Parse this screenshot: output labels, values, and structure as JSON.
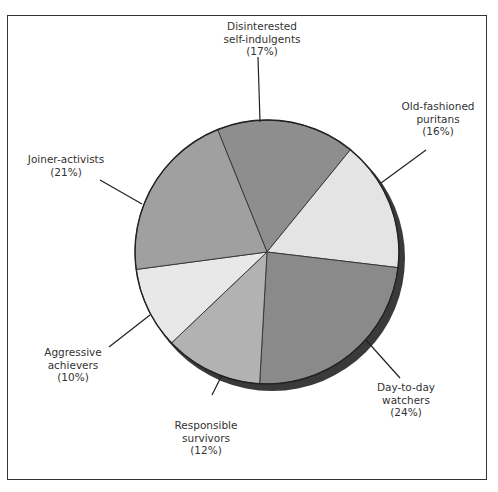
{
  "chart_data": {
    "type": "pie",
    "title": "",
    "categories": [
      "Disinterested self-indulgents",
      "Old-fashioned puritans",
      "Day-to-day watchers",
      "Responsible survivors",
      "Aggressive achievers",
      "Joiner-activists"
    ],
    "values": [
      17,
      16,
      24,
      12,
      10,
      21
    ],
    "unit": "%",
    "colors": [
      "#8e8e8e",
      "#e4e4e4",
      "#8a8a8a",
      "#b2b2b2",
      "#e8e8e8",
      "#a0a0a0"
    ],
    "start_angle_deg": -112,
    "direction": "clockwise",
    "legend": "none (leader-line labels)",
    "shadow": "drop shadow lower-right"
  },
  "labels": [
    {
      "line1": "Disinterested",
      "line2": "self-indulgents",
      "pct": "(17%)"
    },
    {
      "line1": "Old-fashioned",
      "line2": "puritans",
      "pct": "(16%)"
    },
    {
      "line1": "Day-to-day",
      "line2": "watchers",
      "pct": "(24%)"
    },
    {
      "line1": "Responsible",
      "line2": "survivors",
      "pct": "(12%)"
    },
    {
      "line1": "Aggressive",
      "line2": "achievers",
      "pct": "(10%)"
    },
    {
      "line1": "Joiner-activists",
      "line2": "",
      "pct": "(21%)"
    }
  ]
}
